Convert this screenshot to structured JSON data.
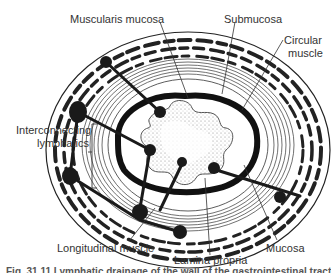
{
  "diagram": {
    "type": "anatomical cross-section",
    "labels": {
      "muscularis_mucosa": "Muscularis mucosa",
      "submucosa": "Submucosa",
      "circular_muscle_line1": "Circular",
      "circular_muscle_line2": "muscle",
      "interconnecting_line1": "Interconnecting",
      "interconnecting_line2": "lymphatics",
      "longitudinal_muscle": "Longitudinal muscle",
      "lamina_propria": "Lamina propria",
      "mucosa": "Mucosa"
    },
    "caption": "Fig. 31.11 Lymphatic drainage of the wall of the gastrointestinal tract",
    "colors": {
      "ink": "#1a1a1a",
      "label_text": "#333333",
      "background": "#ffffff",
      "lumen_stipple": "#888888"
    }
  }
}
